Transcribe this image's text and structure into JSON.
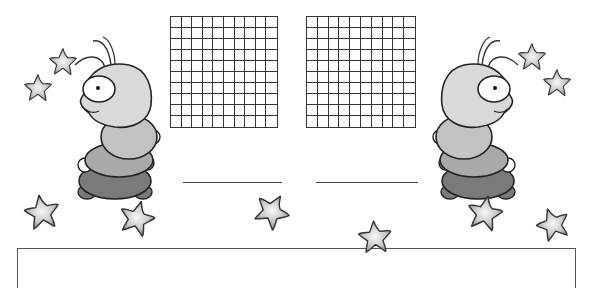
{
  "worksheet": {
    "grids": [
      {
        "id": "left",
        "rows": 10,
        "cols": 10,
        "x": 170,
        "y": 16,
        "width": 108,
        "height": 112
      },
      {
        "id": "right",
        "rows": 10,
        "cols": 10,
        "x": 306,
        "y": 16,
        "width": 110,
        "height": 112
      }
    ],
    "answer_lines": [
      {
        "id": "left",
        "x": 183,
        "y": 182,
        "width": 99
      },
      {
        "id": "right",
        "x": 316,
        "y": 182,
        "width": 102
      }
    ],
    "answer_box": {
      "x": 17,
      "y": 248,
      "width": 559,
      "height": 40
    },
    "colors": {
      "outline": "#333333",
      "head": "#d9d9d9",
      "segment_2": "#c2c2c2",
      "segment_3": "#a9a9a9",
      "segment_4": "#7a7a7a",
      "star_center": "#f5f5f5",
      "star_edge": "#8a8a8a"
    },
    "decorations": {
      "caterpillars": [
        {
          "id": "left",
          "facing": "left"
        },
        {
          "id": "right",
          "facing": "right"
        }
      ],
      "stars": [
        {
          "x": 42,
          "y": 212,
          "r": 18,
          "rot": -10
        },
        {
          "x": 137,
          "y": 218,
          "r": 18,
          "rot": 15
        },
        {
          "x": 272,
          "y": 211,
          "r": 18,
          "rot": 30
        },
        {
          "x": 375,
          "y": 237,
          "r": 17,
          "rot": -5
        },
        {
          "x": 485,
          "y": 213,
          "r": 18,
          "rot": 10
        },
        {
          "x": 553,
          "y": 224,
          "r": 17,
          "rot": -20
        }
      ]
    }
  }
}
